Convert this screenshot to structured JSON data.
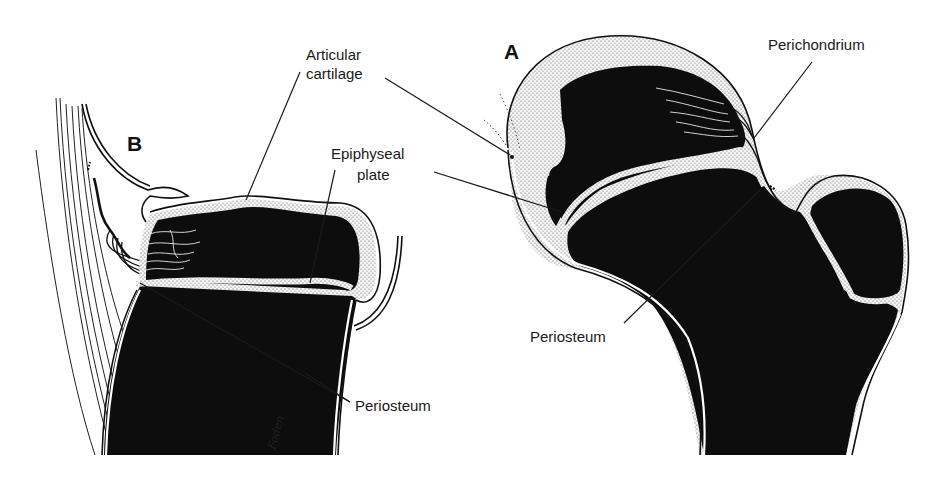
{
  "figure": {
    "panels": [
      {
        "id": "A",
        "letter": "A",
        "description": "Proximal femur with epiphysis"
      },
      {
        "id": "B",
        "letter": "B",
        "description": "Long-bone epiphysis with attached tendons"
      }
    ],
    "labels": {
      "articular_cartilage_line1": "Articular",
      "articular_cartilage_line2": "cartilage",
      "epiphyseal_plate_line1": "Epiphyseal",
      "epiphyseal_plate_line2": "plate",
      "perichondrium": "Perichondrium",
      "periosteum_a": "Periosteum",
      "periosteum_b": "Periosteum"
    },
    "signature": "Foden",
    "colors": {
      "bone": "#0d0d0d",
      "cartilage_stipple": "#bdbdbd",
      "background": "#ffffff",
      "text": "#1a1a1a"
    }
  }
}
